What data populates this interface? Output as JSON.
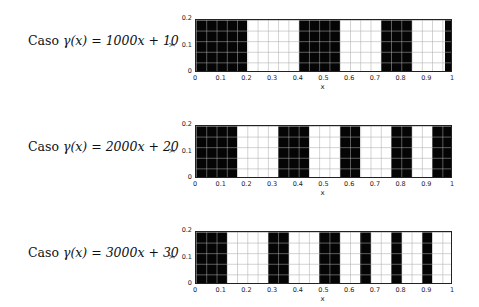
{
  "figure": {
    "panels": [
      {
        "caption_prefix": "Caso",
        "caption_formula": "γ(x) = 1000x + 10"
      },
      {
        "caption_prefix": "Caso",
        "caption_formula": "γ(x) = 2000x + 20"
      },
      {
        "caption_prefix": "Caso",
        "caption_formula": "γ(x) = 3000x + 30"
      }
    ],
    "x_ticks": [
      "0",
      "0.1",
      "0.2",
      "0.3",
      "0.4",
      "0.5",
      "0.6",
      "0.7",
      "0.8",
      "0.9",
      "1"
    ],
    "y_ticks": [
      "0",
      "0.1",
      "0.2"
    ],
    "xlabel": "x",
    "ylabel": "y"
  },
  "chart_data": [
    {
      "type": "heatmap",
      "title": "Caso γ(x) = 1000x + 10",
      "xlabel": "x",
      "ylabel": "y",
      "xlim": [
        0,
        1
      ],
      "ylim": [
        0,
        0.2
      ],
      "grid": true,
      "colors": {
        "filled": "#000000",
        "empty": "#ffffff"
      },
      "filled_intervals_x": [
        [
          0,
          0.2
        ],
        [
          0.4,
          0.56
        ],
        [
          0.72,
          0.84
        ],
        [
          0.97,
          1.0
        ]
      ]
    },
    {
      "type": "heatmap",
      "title": "Caso γ(x) = 2000x + 20",
      "xlabel": "x",
      "ylabel": "y",
      "xlim": [
        0,
        1
      ],
      "ylim": [
        0,
        0.2
      ],
      "grid": true,
      "colors": {
        "filled": "#000000",
        "empty": "#ffffff"
      },
      "filled_intervals_x": [
        [
          0,
          0.16
        ],
        [
          0.32,
          0.44
        ],
        [
          0.56,
          0.64
        ],
        [
          0.76,
          0.84
        ],
        [
          0.92,
          1.0
        ]
      ]
    },
    {
      "type": "heatmap",
      "title": "Caso γ(x) = 3000x + 30",
      "xlabel": "x",
      "ylabel": "y",
      "xlim": [
        0,
        1
      ],
      "ylim": [
        0,
        0.2
      ],
      "grid": true,
      "colors": {
        "filled": "#000000",
        "empty": "#ffffff"
      },
      "filled_intervals_x": [
        [
          0,
          0.12
        ],
        [
          0.28,
          0.36
        ],
        [
          0.48,
          0.56
        ],
        [
          0.64,
          0.68
        ],
        [
          0.76,
          0.8
        ],
        [
          0.88,
          0.92
        ]
      ]
    }
  ]
}
